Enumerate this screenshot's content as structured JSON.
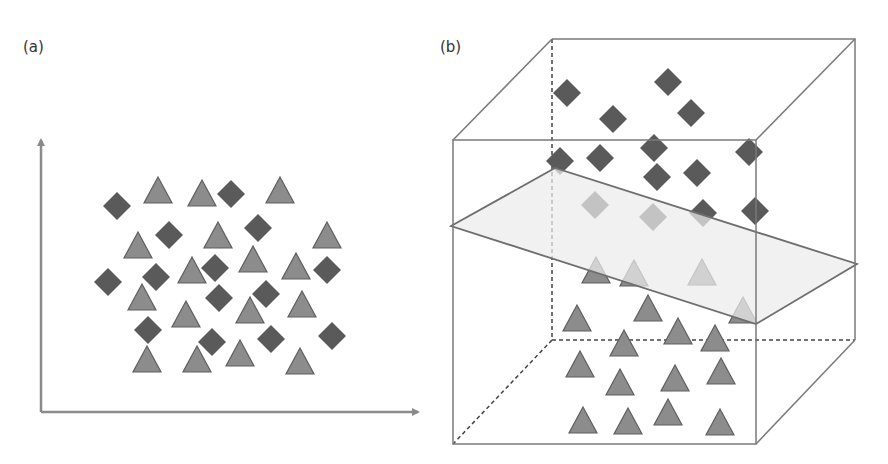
{
  "panels": {
    "a": {
      "label": "(a)",
      "description": "2D scatter of two classes, not linearly separable"
    },
    "b": {
      "label": "(b)",
      "description": "3D feature space with separating hyperplane"
    }
  },
  "colors": {
    "diamond": "#5a5a5a",
    "triangle": "#8c8c8c",
    "triangle_stroke": "#5f5f5f",
    "axis": "#8a8a8a",
    "cube_edge": "#7a7a7a",
    "plane_fill": "#ececec",
    "plane_stroke": "#6e6e6e"
  },
  "legend_semantics": {
    "diamond": "class 1",
    "triangle": "class 2"
  },
  "panel_a": {
    "axes": {
      "origin": [
        41,
        412
      ],
      "y_end": [
        41,
        140
      ],
      "x_end": [
        418,
        412
      ]
    },
    "diamonds": [
      [
        117,
        206
      ],
      [
        231,
        194
      ],
      [
        169,
        235
      ],
      [
        258,
        228
      ],
      [
        108,
        282
      ],
      [
        156,
        277
      ],
      [
        215,
        268
      ],
      [
        327,
        270
      ],
      [
        219,
        298
      ],
      [
        266,
        294
      ],
      [
        148,
        330
      ],
      [
        212,
        342
      ],
      [
        271,
        339
      ],
      [
        332,
        336
      ]
    ],
    "triangles": [
      [
        158,
        190
      ],
      [
        202,
        193
      ],
      [
        280,
        190
      ],
      [
        138,
        245
      ],
      [
        218,
        235
      ],
      [
        327,
        235
      ],
      [
        192,
        270
      ],
      [
        253,
        259
      ],
      [
        296,
        266
      ],
      [
        142,
        297
      ],
      [
        186,
        314
      ],
      [
        250,
        310
      ],
      [
        302,
        304
      ],
      [
        147,
        359
      ],
      [
        197,
        359
      ],
      [
        240,
        353
      ],
      [
        300,
        361
      ]
    ]
  },
  "panel_b": {
    "cube": {
      "front": [
        [
          453,
          140
        ],
        [
          756,
          140
        ],
        [
          756,
          444
        ],
        [
          453,
          444
        ]
      ],
      "back": [
        [
          552,
          39
        ],
        [
          855,
          39
        ],
        [
          855,
          340
        ],
        [
          552,
          340
        ]
      ]
    },
    "plane": [
      [
        451,
        226
      ],
      [
        555,
        168
      ],
      [
        857,
        264
      ],
      [
        756,
        324
      ]
    ],
    "diamonds_above": [
      [
        567,
        93
      ],
      [
        668,
        82
      ],
      [
        613,
        119
      ],
      [
        691,
        113
      ],
      [
        560,
        161
      ],
      [
        600,
        158
      ],
      [
        654,
        148
      ],
      [
        749,
        152
      ],
      [
        657,
        177
      ],
      [
        697,
        173
      ],
      [
        755,
        211
      ]
    ],
    "diamonds_behind_plane": [
      [
        595,
        205
      ],
      [
        653,
        217
      ],
      [
        703,
        213
      ]
    ],
    "triangles_behind_plane": [
      [
        596,
        270
      ],
      [
        634,
        273
      ],
      [
        702,
        272
      ],
      [
        743,
        310
      ]
    ],
    "triangles_below": [
      [
        577,
        318
      ],
      [
        648,
        308
      ],
      [
        624,
        343
      ],
      [
        678,
        331
      ],
      [
        715,
        338
      ],
      [
        580,
        364
      ],
      [
        620,
        382
      ],
      [
        675,
        378
      ],
      [
        721,
        371
      ],
      [
        583,
        420
      ],
      [
        628,
        421
      ],
      [
        668,
        412
      ],
      [
        720,
        422
      ]
    ]
  }
}
